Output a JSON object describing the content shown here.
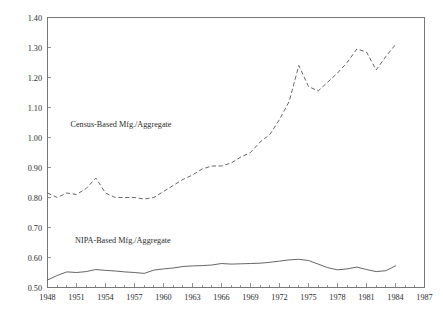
{
  "chart_data": {
    "type": "line",
    "title": "",
    "subtitle": "",
    "xlabel": "",
    "ylabel": "",
    "xlim": [
      1948,
      1987
    ],
    "ylim": [
      0.5,
      1.4
    ],
    "grid": false,
    "legend_position": "inline-annotations",
    "y_ticks": [
      "0.50",
      "0.60",
      "0.70",
      "0.80",
      "0.90",
      "1.00",
      "1.10",
      "1.20",
      "1.30",
      "1.40"
    ],
    "y_tick_values": [
      0.5,
      0.6,
      0.7,
      0.8,
      0.9,
      1.0,
      1.1,
      1.2,
      1.3,
      1.4
    ],
    "x_ticks": [
      "1948",
      "1951",
      "1954",
      "1957",
      "1960",
      "1963",
      "1966",
      "1969",
      "1972",
      "1975",
      "1978",
      "1981",
      "1984",
      "1987"
    ],
    "x_tick_values": [
      1948,
      1951,
      1954,
      1957,
      1960,
      1963,
      1966,
      1969,
      1972,
      1975,
      1978,
      1981,
      1984,
      1987
    ],
    "x": [
      1948,
      1949,
      1950,
      1951,
      1952,
      1953,
      1954,
      1955,
      1956,
      1957,
      1958,
      1959,
      1960,
      1961,
      1962,
      1963,
      1964,
      1965,
      1966,
      1967,
      1968,
      1969,
      1970,
      1971,
      1972,
      1973,
      1974,
      1975,
      1976,
      1977,
      1978,
      1979,
      1980,
      1981,
      1982,
      1983,
      1984
    ],
    "series": [
      {
        "name": "Census-Based Mfg./Aggregate",
        "style": "dashed",
        "color": "#555555",
        "annotation": "Census-Based Mfg./Aggregate",
        "annotation_x": 1955.6,
        "annotation_y": 1.035,
        "values": [
          0.815,
          0.8,
          0.815,
          0.81,
          0.83,
          0.865,
          0.815,
          0.8,
          0.8,
          0.8,
          0.795,
          0.8,
          0.82,
          0.84,
          0.86,
          0.875,
          0.895,
          0.905,
          0.905,
          0.915,
          0.935,
          0.95,
          0.985,
          1.01,
          1.06,
          1.12,
          1.24,
          1.17,
          1.155,
          1.185,
          1.215,
          1.25,
          1.295,
          1.285,
          1.225,
          1.27,
          1.31
        ]
      },
      {
        "name": "NIPA-Based Mfg./Aggregate",
        "style": "solid",
        "color": "#555555",
        "annotation": "NIPA-Based Mfg./Aggregate",
        "annotation_x": 1955.8,
        "annotation_y": 0.648,
        "values": [
          0.525,
          0.54,
          0.552,
          0.55,
          0.553,
          0.56,
          0.557,
          0.555,
          0.552,
          0.55,
          0.547,
          0.558,
          0.562,
          0.565,
          0.57,
          0.572,
          0.573,
          0.575,
          0.58,
          0.578,
          0.579,
          0.58,
          0.581,
          0.584,
          0.588,
          0.592,
          0.594,
          0.59,
          0.578,
          0.566,
          0.559,
          0.562,
          0.568,
          0.56,
          0.553,
          0.556,
          0.572
        ]
      }
    ]
  }
}
